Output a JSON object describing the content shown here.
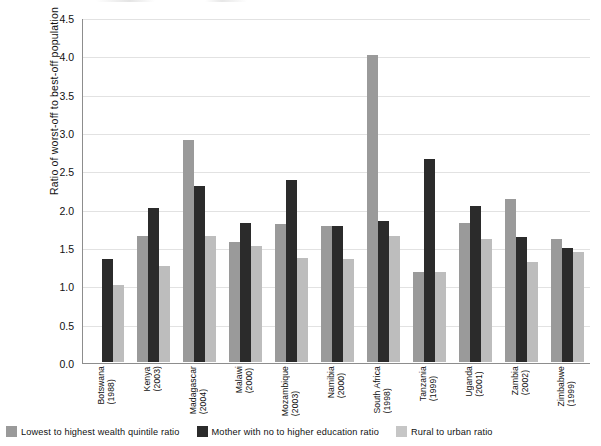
{
  "chart_data": {
    "type": "bar",
    "title": "",
    "xlabel": "",
    "ylabel": "Ratio of worst-off to best-off population",
    "ylim": [
      0.0,
      4.5
    ],
    "ytick_labels": [
      "0.0",
      "0.5",
      "1.0",
      "1.5",
      "2.0",
      "2.5",
      "3.0",
      "3.5",
      "4.0",
      "4.5"
    ],
    "ytick_values": [
      0.0,
      0.5,
      1.0,
      1.5,
      2.0,
      2.5,
      3.0,
      3.5,
      4.0,
      4.5
    ],
    "grid": true,
    "legend_position": "bottom-left",
    "categories": [
      "Botswana (1988)",
      "Kenya (2003)",
      "Madagascar (2004)",
      "Malawi (2000)",
      "Mozambique (2003)",
      "Namibia (2000)",
      "South Africa (1998)",
      "Tanzania (1999)",
      "Uganda (2001)",
      "Zambia (2002)",
      "Zimbabwe (1999)"
    ],
    "category_lines": [
      [
        "Botswana",
        "(1988)"
      ],
      [
        "Kenya",
        "(2003)"
      ],
      [
        "Madagascar",
        "(2004)"
      ],
      [
        "Malawi",
        "(2000)"
      ],
      [
        "Mozambique",
        "(2003)"
      ],
      [
        "Namibia",
        "(2000)"
      ],
      [
        "South Africa",
        "(1998)"
      ],
      [
        "Tanzania",
        "(1999)"
      ],
      [
        "Uganda",
        "(2001)"
      ],
      [
        "Zambia",
        "(2002)"
      ],
      [
        "Zimbabwe",
        "(1999)"
      ]
    ],
    "series": [
      {
        "name": "Lowest to highest wealth quintile ratio",
        "color": "#9a9a9a",
        "values": [
          null,
          1.64,
          2.9,
          1.56,
          1.8,
          1.77,
          4.01,
          1.18,
          1.81,
          2.12,
          1.6
        ]
      },
      {
        "name": "Mother with no to higher education ratio",
        "color": "#2b2b2b",
        "values": [
          1.35,
          2.01,
          2.29,
          1.81,
          2.38,
          1.77,
          1.84,
          2.65,
          2.04,
          1.63,
          1.49
        ]
      },
      {
        "name": "Rural to urban ratio",
        "color": "#c6c6c6",
        "values": [
          1.0,
          1.25,
          1.64,
          1.51,
          1.36,
          1.35,
          1.64,
          1.18,
          1.61,
          1.3,
          1.43
        ]
      }
    ]
  },
  "legend": {
    "items": [
      {
        "label": "Lowest to highest wealth quintile ratio",
        "swatch": "s0"
      },
      {
        "label": "Mother with no to higher education ratio",
        "swatch": "s1"
      },
      {
        "label": "Rural to urban ratio",
        "swatch": "s2"
      }
    ]
  },
  "axis": {
    "y_title": "Ratio of worst-off to best-off population"
  },
  "colors": {
    "series_quintile": "#9a9a9a",
    "series_education": "#2b2b2b",
    "series_rural": "#c6c6c6",
    "grid": "#e2e2e2",
    "axis": "#8d8d8d",
    "background": "#ffffff"
  }
}
